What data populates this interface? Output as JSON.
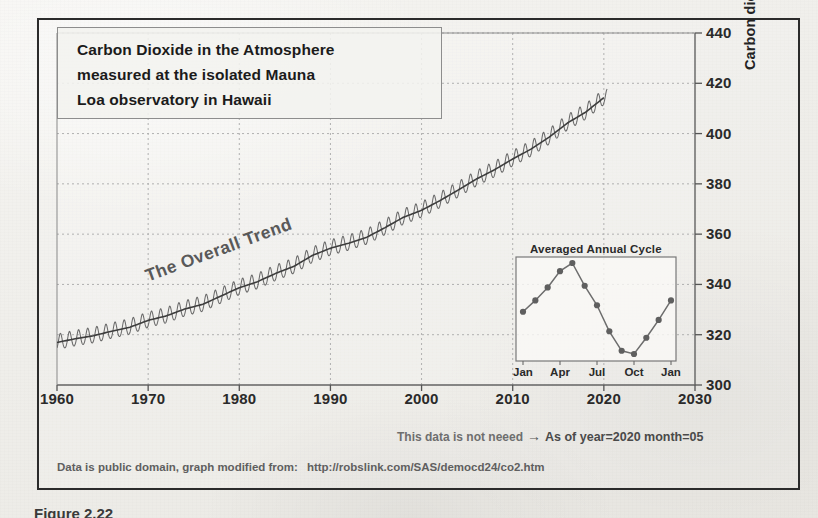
{
  "title": {
    "lines": [
      "Carbon Dioxide in the Atmosphere",
      "measured at the isolated Mauna",
      "Loa observatory in Hawaii"
    ]
  },
  "annotations": {
    "trend_label": "The Overall Trend",
    "note_left": "This data is not neeed",
    "note_arrow": "→",
    "note_right": "As of year=2020 month=05",
    "footer_text": "Data is public domain, graph modified from:",
    "footer_url": "http://robslink.com/SAS/democd24/co2.htm",
    "caption": "Figure 2.22"
  },
  "colors": {
    "frame": "#2b2b2b",
    "curve": "#4a4a4a",
    "trend": "#555555",
    "grid": "#b9b9b9",
    "marker": "#6b6b6b",
    "paper": "#f2f1ee"
  },
  "chart_data": {
    "type": "line",
    "title": "Carbon Dioxide in the Atmosphere measured at the isolated Mauna Loa observatory in Hawaii",
    "xlabel": "",
    "ylabel": "Carbon dioxide concentration (ppmv)",
    "xlim": [
      1960,
      2030
    ],
    "ylim": [
      300,
      440
    ],
    "xticks": [
      1960,
      1970,
      1980,
      1990,
      2000,
      2010,
      2020,
      2030
    ],
    "yticks": [
      300,
      320,
      340,
      360,
      380,
      400,
      420,
      440
    ],
    "grid": true,
    "y_axis_position": "right",
    "series": [
      {
        "name": "Monthly mean CO2 (with seasonal cycle)",
        "note": "annual sawtooth, amplitude approx 6 ppmv peak-to-peak",
        "seasonal_amplitude": 3.1,
        "x": [
          1960,
          1962,
          1964,
          1966,
          1968,
          1970,
          1972,
          1974,
          1976,
          1978,
          1980,
          1982,
          1984,
          1986,
          1988,
          1990,
          1992,
          1994,
          1996,
          1998,
          2000,
          2002,
          2004,
          2006,
          2008,
          2010,
          2012,
          2014,
          2016,
          2018,
          2020
        ],
        "values": [
          316.9,
          318.4,
          319.6,
          321.4,
          323.0,
          325.7,
          327.5,
          330.2,
          332.1,
          335.4,
          338.7,
          341.1,
          344.4,
          347.2,
          351.5,
          354.4,
          356.4,
          358.8,
          362.6,
          366.7,
          369.5,
          373.3,
          377.5,
          381.9,
          385.6,
          389.9,
          393.8,
          398.6,
          404.2,
          408.5,
          414.3
        ]
      },
      {
        "name": "The Overall Trend",
        "note": "smoothed de-seasonalized trend line",
        "x": [
          1960,
          1970,
          1980,
          1990,
          2000,
          2010,
          2020
        ],
        "values": [
          316.9,
          325.7,
          338.7,
          354.4,
          369.5,
          389.9,
          414.3
        ]
      }
    ],
    "inset": {
      "type": "line",
      "title": "Averaged Annual Cycle",
      "xlabel": "",
      "ylabel": "",
      "xticks": [
        "Jan",
        "Apr",
        "Jul",
        "Oct",
        "Jan"
      ],
      "categories": [
        "Jan",
        "Feb",
        "Mar",
        "Apr",
        "May",
        "Jun",
        "Jul",
        "Aug",
        "Sep",
        "Oct",
        "Nov",
        "Dec",
        "Jan"
      ],
      "values": [
        0.25,
        0.95,
        1.75,
        2.75,
        3.25,
        1.85,
        0.65,
        -0.95,
        -2.15,
        -2.35,
        -1.35,
        -0.25,
        0.95
      ],
      "markers": true
    }
  },
  "axis_labels": {
    "x": [
      "1960",
      "1970",
      "1980",
      "1990",
      "2000",
      "2010",
      "2020",
      "2030"
    ],
    "y": [
      "300",
      "320",
      "340",
      "360",
      "380",
      "400",
      "420",
      "440"
    ]
  },
  "inset_axis_labels": {
    "x": [
      "Jan",
      "Apr",
      "Jul",
      "Oct",
      "Jan"
    ]
  }
}
